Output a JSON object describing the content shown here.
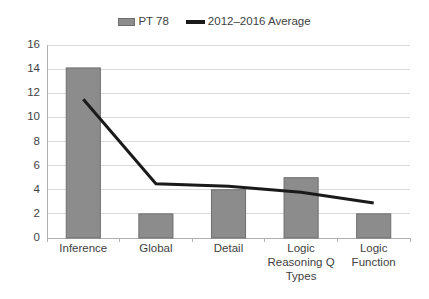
{
  "chart_data": {
    "type": "bar",
    "title": "",
    "subtitle": "",
    "xlabel": "Logic Reasoning Q Types",
    "ylabel": "",
    "categories": [
      "Inference",
      "Global",
      "Detail",
      "Logic Reasoning Q Types",
      "Logic Function"
    ],
    "ylim": [
      0,
      16
    ],
    "ytick_step": 2,
    "yticks": [
      16,
      14,
      12,
      10,
      8,
      6,
      4,
      2,
      0
    ],
    "grid": true,
    "legend_position": "top-center",
    "series": [
      {
        "name": "PT 78",
        "type": "bar",
        "color": "#8c8c8c",
        "values": [
          14.1,
          2.0,
          4.0,
          5.0,
          2.0
        ]
      },
      {
        "name": "2012–2016 Average",
        "type": "line",
        "color": "#1a1a1a",
        "values": [
          11.5,
          4.5,
          4.3,
          3.8,
          2.9
        ]
      }
    ]
  },
  "legend": {
    "items": [
      {
        "label": "PT 78",
        "marker": "bar-swatch",
        "color": "#8c8c8c"
      },
      {
        "label": "2012–2016 Average",
        "marker": "line-swatch",
        "color": "#1a1a1a"
      }
    ]
  },
  "axes": {
    "y": {
      "labels": [
        "16",
        "14",
        "12",
        "10",
        "8",
        "6",
        "4",
        "2",
        "0"
      ]
    },
    "x": {
      "labels": [
        "Inference",
        "Global",
        "Detail",
        "Logic Reasoning Q Types",
        "Logic Function"
      ]
    }
  },
  "colors": {
    "bar_fill": "#8c8c8c",
    "bar_stroke": "#6f6f6f",
    "line": "#1a1a1a",
    "grid": "#d9d9d9",
    "axis": "#b0b0b0",
    "text": "#3f3f3f",
    "background": "#ffffff"
  }
}
